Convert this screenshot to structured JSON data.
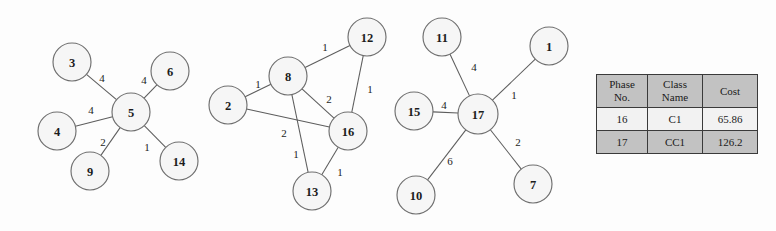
{
  "figure": {
    "background_color": "#fdfdfd",
    "node_fill": "#f6f6f6",
    "node_stroke": "#6f6f6f",
    "edge_stroke": "#5d5d5d"
  },
  "graphs": [
    {
      "id": "graph-1",
      "nodes": [
        {
          "id": "3",
          "label": "3",
          "cx": 72,
          "cy": 62,
          "r": 19
        },
        {
          "id": "6",
          "label": "6",
          "cx": 170,
          "cy": 71,
          "r": 19
        },
        {
          "id": "4",
          "label": "4",
          "cx": 57,
          "cy": 131,
          "r": 19
        },
        {
          "id": "5",
          "label": "5",
          "cx": 131,
          "cy": 112,
          "r": 19
        },
        {
          "id": "9",
          "label": "9",
          "cx": 90,
          "cy": 171,
          "r": 19
        },
        {
          "id": "14",
          "label": "14",
          "cx": 179,
          "cy": 161,
          "r": 19
        }
      ],
      "edges": [
        {
          "from": "3",
          "to": "5",
          "weight": "4",
          "lx": 102,
          "ly": 78
        },
        {
          "from": "6",
          "to": "5",
          "weight": "4",
          "lx": 144,
          "ly": 80
        },
        {
          "from": "4",
          "to": "5",
          "weight": "4",
          "lx": 91,
          "ly": 110
        },
        {
          "from": "9",
          "to": "5",
          "weight": "2",
          "lx": 103,
          "ly": 142
        },
        {
          "from": "14",
          "to": "5",
          "weight": "1",
          "lx": 147,
          "ly": 147
        }
      ]
    },
    {
      "id": "graph-2",
      "nodes": [
        {
          "id": "12",
          "label": "12",
          "cx": 367,
          "cy": 37,
          "r": 19
        },
        {
          "id": "8",
          "label": "8",
          "cx": 288,
          "cy": 76,
          "r": 19
        },
        {
          "id": "2",
          "label": "2",
          "cx": 228,
          "cy": 105,
          "r": 19
        },
        {
          "id": "16",
          "label": "16",
          "cx": 348,
          "cy": 131,
          "r": 19
        },
        {
          "id": "13",
          "label": "13",
          "cx": 312,
          "cy": 191,
          "r": 19
        }
      ],
      "edges": [
        {
          "from": "8",
          "to": "12",
          "weight": "1",
          "lx": 325,
          "ly": 47
        },
        {
          "from": "2",
          "to": "8",
          "weight": "1",
          "lx": 258,
          "ly": 84
        },
        {
          "from": "8",
          "to": "16",
          "weight": "2",
          "lx": 329,
          "ly": 99
        },
        {
          "from": "12",
          "to": "16",
          "weight": "1",
          "lx": 370,
          "ly": 89
        },
        {
          "from": "2",
          "to": "16",
          "weight": "2",
          "lx": 284,
          "ly": 133
        },
        {
          "from": "8",
          "to": "13",
          "weight": "1",
          "lx": 296,
          "ly": 154
        },
        {
          "from": "16",
          "to": "13",
          "weight": "1",
          "lx": 340,
          "ly": 172
        }
      ]
    },
    {
      "id": "graph-3",
      "nodes": [
        {
          "id": "11",
          "label": "11",
          "cx": 442,
          "cy": 37,
          "r": 19
        },
        {
          "id": "1",
          "label": "1",
          "cx": 549,
          "cy": 46,
          "r": 19
        },
        {
          "id": "15",
          "label": "15",
          "cx": 414,
          "cy": 111,
          "r": 19
        },
        {
          "id": "17",
          "label": "17",
          "cx": 478,
          "cy": 114,
          "r": 20
        },
        {
          "id": "10",
          "label": "10",
          "cx": 416,
          "cy": 195,
          "r": 19
        },
        {
          "id": "7",
          "label": "7",
          "cx": 533,
          "cy": 184,
          "r": 19
        }
      ],
      "edges": [
        {
          "from": "11",
          "to": "17",
          "weight": "4",
          "lx": 474,
          "ly": 67
        },
        {
          "from": "1",
          "to": "17",
          "weight": "1",
          "lx": 514,
          "ly": 95
        },
        {
          "from": "15",
          "to": "17",
          "weight": "4",
          "lx": 444,
          "ly": 105
        },
        {
          "from": "10",
          "to": "17",
          "weight": "6",
          "lx": 450,
          "ly": 161
        },
        {
          "from": "7",
          "to": "17",
          "weight": "2",
          "lx": 518,
          "ly": 142
        }
      ]
    }
  ],
  "table": {
    "headers": [
      {
        "line1": "Phase",
        "line2": "No."
      },
      {
        "line1": "Class",
        "line2": "Name"
      },
      {
        "line1": "Cost",
        "line2": ""
      }
    ],
    "rows": [
      {
        "phase_no": "16",
        "class_name": "C1",
        "cost": "65.86"
      },
      {
        "phase_no": "17",
        "class_name": "CC1",
        "cost": "126.2"
      }
    ]
  }
}
